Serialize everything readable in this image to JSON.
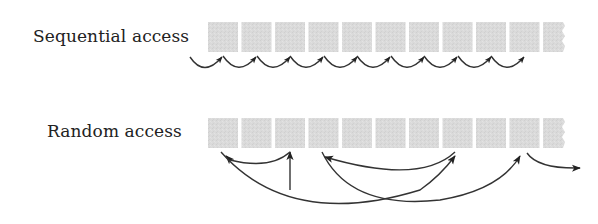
{
  "diagram": {
    "rows": [
      {
        "label": "Sequential access",
        "cell_count": 10,
        "has_partial_cell": true,
        "arrows": "Each step jumps from one cell to the immediately next cell in order"
      },
      {
        "label": "Random access",
        "cell_count": 10,
        "has_partial_cell": true,
        "arrows": "Entry arrow points up at cell 3; jumps: cell 3 -> cell 1, cell 1 -> cell 7, cell 8 -> cell 4, cell 4 -> cell 10, then exit arrow to the right"
      }
    ],
    "colors": {
      "cell_fill": "#d9d9d9",
      "arrow": "#222222",
      "text": "#222222",
      "background": "#ffffff"
    }
  }
}
